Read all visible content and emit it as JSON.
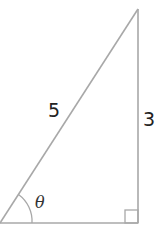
{
  "diagram": {
    "type": "right-triangle",
    "hypotenuse_label": "5",
    "opposite_label": "3",
    "angle_label": "θ",
    "line_color": "#a8a8a8",
    "right_angle_marker": true
  }
}
